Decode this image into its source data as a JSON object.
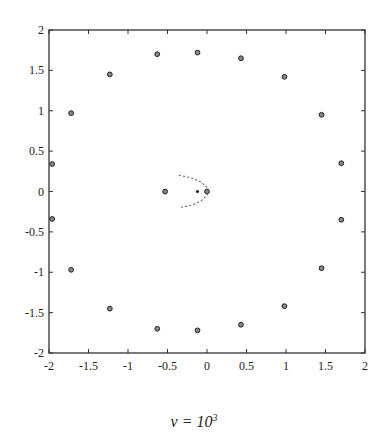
{
  "chart_data": {
    "type": "scatter",
    "title": "",
    "xlabel": "",
    "ylabel": "",
    "xlim": [
      -2,
      2
    ],
    "ylim": [
      -2,
      2
    ],
    "grid": false,
    "legend": null,
    "x_ticks": [
      "-2",
      "-1.5",
      "-1",
      "-0.5",
      "0",
      "0.5",
      "1",
      "1.5",
      "2"
    ],
    "y_ticks": [
      "-2",
      "-1.5",
      "-1",
      "-0.5",
      "0",
      "0.5",
      "1",
      "1.5",
      "2"
    ],
    "series": [
      {
        "name": "eigenvalues (circles)",
        "marker": "circle",
        "points": [
          [
            -1.96,
            0.34
          ],
          [
            -1.72,
            0.97
          ],
          [
            -1.23,
            1.45
          ],
          [
            -0.63,
            1.7
          ],
          [
            -0.12,
            1.72
          ],
          [
            0.43,
            1.65
          ],
          [
            0.98,
            1.42
          ],
          [
            1.45,
            0.95
          ],
          [
            1.7,
            0.35
          ],
          [
            -1.96,
            -0.34
          ],
          [
            -1.72,
            -0.97
          ],
          [
            -1.23,
            -1.45
          ],
          [
            -0.63,
            -1.7
          ],
          [
            -0.12,
            -1.72
          ],
          [
            0.43,
            -1.65
          ],
          [
            0.98,
            -1.42
          ],
          [
            1.45,
            -0.95
          ],
          [
            1.7,
            -0.35
          ],
          [
            -0.53,
            0.0
          ],
          [
            0.0,
            0.0
          ]
        ]
      },
      {
        "name": "small dot",
        "marker": "dot",
        "points": [
          [
            -0.12,
            0.0
          ]
        ]
      },
      {
        "name": "parabolic dotted curve",
        "marker": "dotted-line",
        "points": [
          [
            -0.35,
            0.2
          ],
          [
            -0.2,
            0.17
          ],
          [
            -0.08,
            0.12
          ],
          [
            0.0,
            0.05
          ],
          [
            0.02,
            0.0
          ],
          [
            0.0,
            -0.05
          ],
          [
            -0.08,
            -0.12
          ],
          [
            -0.2,
            -0.17
          ],
          [
            -0.35,
            -0.2
          ]
        ]
      }
    ],
    "caption": "ν = 10^3"
  },
  "caption": {
    "prefix": "ν = 10",
    "exponent": "3"
  }
}
